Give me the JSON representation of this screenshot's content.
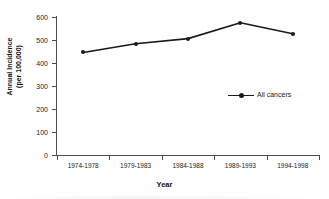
{
  "chart_data": {
    "type": "line",
    "title": "",
    "xlabel": "Year",
    "ylabel": "Annual Incidence\n(per 100,000)",
    "ylabel_line1": "Annual Incidence",
    "ylabel_line2": "(per 100,000)",
    "categories": [
      "1974-1978",
      "1979-1983",
      "1984-1988",
      "1989-1993",
      "1994-1998"
    ],
    "values": [
      446,
      484,
      506,
      575,
      527
    ],
    "series": [
      {
        "name": "All cancers",
        "values": [
          446,
          484,
          506,
          575,
          527
        ],
        "color": "#1a1a1a"
      }
    ],
    "ylim": [
      0,
      600
    ],
    "yticks": [
      0,
      100,
      200,
      300,
      400,
      500,
      600
    ],
    "ytick_labels": [
      "0",
      "100",
      "200",
      "300",
      "400",
      "500",
      "600"
    ],
    "grid": false,
    "legend_position": "inside-right",
    "legend": [
      "All cancers"
    ],
    "marker": "square",
    "line_color": "#1a1a1a"
  },
  "figure": {
    "title_sliver": "…",
    "axis_color": "#4d4d4d",
    "background": "#ffffff"
  }
}
